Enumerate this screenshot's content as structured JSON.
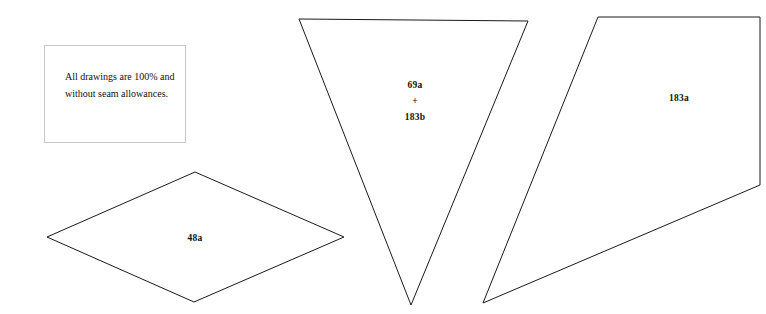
{
  "canvas": {
    "width": 766,
    "height": 314,
    "background_color": "#ffffff",
    "line_color": "#1a1a1a"
  },
  "note": {
    "text": "All drawings are 100% and without seam allowances.",
    "border_color": "#c8c8c8",
    "x": 44,
    "y": 45,
    "width": 142,
    "height": 98
  },
  "pieces": {
    "diamond": {
      "label": "48a",
      "points": "47,237 195,172 344,237 194,302",
      "label_x": 195,
      "label_y": 238
    },
    "triangle": {
      "label_line1": "69a",
      "label_plus": "+",
      "label_line2": "183b",
      "points": "299,19 528,21 411,305",
      "label_x": 415,
      "label_y": 101
    },
    "right_piece": {
      "label": "183a",
      "points": "598,17 760,17 760,185 483,303",
      "label_x": 679,
      "label_y": 98
    }
  }
}
